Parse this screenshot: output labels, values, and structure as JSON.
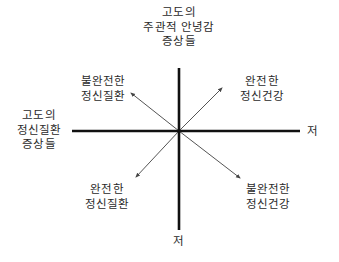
{
  "diagram": {
    "axes": {
      "vertical_top_label": [
        "고도의",
        "주관적 안녕감",
        "증상들"
      ],
      "vertical_bottom_label": "저",
      "horizontal_left_label": [
        "고도의",
        "정신질환",
        "증상들"
      ],
      "horizontal_right_label": "저"
    },
    "quadrants": {
      "upper_left": [
        "불완전한",
        "정신질환"
      ],
      "upper_right": [
        "완전한",
        "정신건강"
      ],
      "lower_left": [
        "완전한",
        "정신질환"
      ],
      "lower_right": [
        "불완전한",
        "정신건강"
      ]
    },
    "colors": {
      "axis": "#111111",
      "arrow": "#555555",
      "text": "#2a2a2a",
      "background": "#ffffff"
    }
  }
}
